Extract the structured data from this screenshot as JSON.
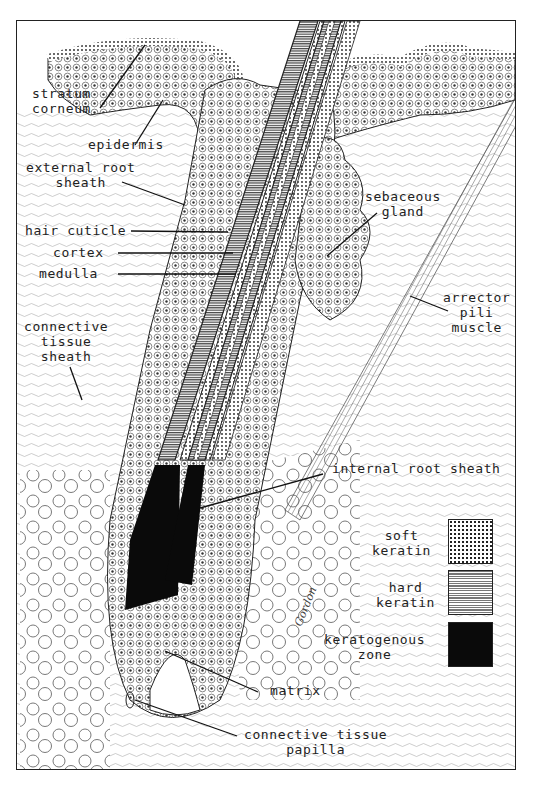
{
  "figure": {
    "type": "histological diagram",
    "signature": "Gordon"
  },
  "labels": {
    "stratum_corneum": [
      "stratum",
      "corneum"
    ],
    "epidermis": "epidermis",
    "external_root_sheath": [
      "external root",
      "sheath"
    ],
    "hair_cuticle": "hair cuticle",
    "cortex": "cortex",
    "medulla": "medulla",
    "connective_tissue_sheath": [
      "connective",
      "tissue",
      "sheath"
    ],
    "sebaceous_gland": [
      "sebaceous",
      "gland"
    ],
    "arrector_pili_muscle": [
      "arrector",
      "pili",
      "muscle"
    ],
    "internal_root_sheath": "internal root sheath",
    "matrix": "matrix",
    "connective_tissue_papilla": [
      "connective tissue",
      "papilla"
    ]
  },
  "legend": {
    "items": [
      {
        "label": [
          "soft",
          "keratin"
        ],
        "pattern": "dotted"
      },
      {
        "label": [
          "hard",
          "keratin"
        ],
        "pattern": "horizontal-lines"
      },
      {
        "label": [
          "keratogenous",
          "zone"
        ],
        "pattern": "solid-black"
      }
    ]
  },
  "colors": {
    "ink": "#222222",
    "paper": "#ffffff",
    "hard_keratin": "#9a9a9a"
  }
}
